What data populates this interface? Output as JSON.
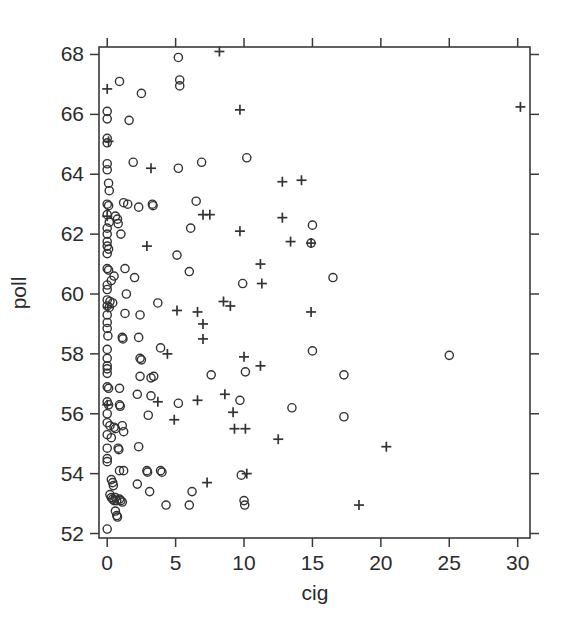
{
  "chart_data": {
    "type": "scatter",
    "title": "",
    "xlabel": "cig",
    "ylabel": "poll",
    "xlim": [
      -0.6,
      30.9
    ],
    "ylim": [
      51.85,
      68.25
    ],
    "xticks": [
      0,
      5,
      10,
      15,
      20,
      25,
      30
    ],
    "xtick_labels": [
      "0",
      "5",
      "10",
      "15",
      "20",
      "25",
      "30"
    ],
    "yticks": [
      52,
      54,
      56,
      58,
      60,
      62,
      64,
      66,
      68
    ],
    "ytick_labels": [
      "52",
      "54",
      "56",
      "58",
      "60",
      "62",
      "64",
      "66",
      "68"
    ],
    "grid": false,
    "legend": null,
    "legend_position": "none",
    "box_frame": true,
    "tick_direction": "outward",
    "ticks_on_all_sides": true,
    "marker_color": "#333333",
    "axis_color": "#3a3a3a",
    "background_color": "#ffffff",
    "series": [
      {
        "name": "open-circle",
        "marker": "circle",
        "points": [
          [
            5.2,
            67.9
          ],
          [
            0.9,
            67.1
          ],
          [
            5.3,
            67.15
          ],
          [
            5.3,
            66.95
          ],
          [
            2.5,
            66.7
          ],
          [
            0.0,
            66.1
          ],
          [
            0.0,
            65.85
          ],
          [
            1.6,
            65.8
          ],
          [
            0.0,
            65.2
          ],
          [
            0.0,
            65.05
          ],
          [
            0.0,
            64.35
          ],
          [
            0.0,
            64.15
          ],
          [
            1.9,
            64.4
          ],
          [
            5.2,
            64.2
          ],
          [
            6.9,
            64.4
          ],
          [
            10.2,
            64.55
          ],
          [
            0.1,
            63.7
          ],
          [
            0.15,
            63.45
          ],
          [
            0.0,
            63.0
          ],
          [
            0.1,
            62.95
          ],
          [
            1.2,
            63.05
          ],
          [
            1.5,
            63.0
          ],
          [
            2.3,
            62.9
          ],
          [
            3.3,
            63.0
          ],
          [
            3.35,
            62.95
          ],
          [
            6.5,
            63.1
          ],
          [
            0.0,
            62.65
          ],
          [
            0.6,
            62.6
          ],
          [
            0.75,
            62.5
          ],
          [
            0.15,
            62.4
          ],
          [
            0.0,
            62.2
          ],
          [
            0.0,
            62.0
          ],
          [
            1.0,
            62.0
          ],
          [
            0.8,
            62.35
          ],
          [
            6.1,
            62.2
          ],
          [
            15.0,
            62.3
          ],
          [
            0.0,
            61.75
          ],
          [
            0.0,
            61.6
          ],
          [
            0.1,
            61.5
          ],
          [
            0.0,
            61.35
          ],
          [
            5.1,
            61.3
          ],
          [
            14.9,
            61.7
          ],
          [
            0.0,
            60.85
          ],
          [
            0.1,
            60.8
          ],
          [
            1.3,
            60.85
          ],
          [
            0.5,
            60.6
          ],
          [
            2.0,
            60.55
          ],
          [
            6.0,
            60.75
          ],
          [
            0.3,
            60.45
          ],
          [
            0.0,
            60.3
          ],
          [
            0.0,
            60.15
          ],
          [
            9.9,
            60.35
          ],
          [
            16.5,
            60.55
          ],
          [
            1.4,
            60.0
          ],
          [
            0.0,
            59.8
          ],
          [
            0.2,
            59.75
          ],
          [
            0.4,
            59.7
          ],
          [
            0.0,
            59.6
          ],
          [
            0.15,
            59.55
          ],
          [
            3.7,
            59.7
          ],
          [
            0.0,
            59.3
          ],
          [
            1.3,
            59.35
          ],
          [
            2.4,
            59.3
          ],
          [
            0.0,
            59.05
          ],
          [
            0.0,
            58.85
          ],
          [
            0.05,
            58.6
          ],
          [
            1.1,
            58.55
          ],
          [
            1.15,
            58.5
          ],
          [
            2.3,
            58.55
          ],
          [
            3.9,
            58.2
          ],
          [
            0.0,
            58.15
          ],
          [
            0.0,
            57.85
          ],
          [
            2.4,
            57.85
          ],
          [
            2.5,
            57.8
          ],
          [
            15.0,
            58.1
          ],
          [
            25.0,
            57.95
          ],
          [
            0.0,
            57.6
          ],
          [
            0.0,
            57.5
          ],
          [
            0.0,
            57.35
          ],
          [
            2.4,
            57.25
          ],
          [
            3.2,
            57.2
          ],
          [
            3.4,
            57.25
          ],
          [
            7.6,
            57.3
          ],
          [
            10.1,
            57.4
          ],
          [
            17.3,
            57.3
          ],
          [
            0.0,
            56.9
          ],
          [
            0.1,
            56.85
          ],
          [
            0.9,
            56.85
          ],
          [
            2.2,
            56.65
          ],
          [
            3.2,
            56.6
          ],
          [
            0.0,
            56.4
          ],
          [
            0.1,
            56.3
          ],
          [
            0.9,
            56.3
          ],
          [
            0.95,
            56.25
          ],
          [
            5.2,
            56.35
          ],
          [
            9.7,
            56.45
          ],
          [
            13.5,
            56.2
          ],
          [
            0.0,
            56.0
          ],
          [
            3.0,
            55.95
          ],
          [
            17.3,
            55.9
          ],
          [
            0.0,
            55.7
          ],
          [
            0.2,
            55.6
          ],
          [
            0.5,
            55.55
          ],
          [
            0.6,
            55.5
          ],
          [
            1.1,
            55.6
          ],
          [
            0.0,
            55.3
          ],
          [
            0.3,
            55.2
          ],
          [
            1.2,
            55.4
          ],
          [
            0.0,
            54.85
          ],
          [
            0.8,
            54.85
          ],
          [
            0.85,
            54.8
          ],
          [
            2.3,
            54.9
          ],
          [
            0.0,
            54.5
          ],
          [
            0.0,
            54.4
          ],
          [
            0.9,
            54.1
          ],
          [
            1.2,
            54.1
          ],
          [
            2.9,
            54.1
          ],
          [
            2.95,
            54.05
          ],
          [
            3.9,
            54.1
          ],
          [
            4.0,
            54.05
          ],
          [
            9.8,
            53.95
          ],
          [
            0.3,
            53.8
          ],
          [
            0.4,
            53.7
          ],
          [
            0.45,
            53.6
          ],
          [
            2.2,
            53.65
          ],
          [
            0.2,
            53.3
          ],
          [
            0.3,
            53.2
          ],
          [
            0.4,
            53.15
          ],
          [
            0.5,
            53.1
          ],
          [
            0.6,
            53.2
          ],
          [
            0.7,
            53.1
          ],
          [
            0.9,
            53.15
          ],
          [
            1.0,
            53.1
          ],
          [
            1.1,
            53.05
          ],
          [
            3.1,
            53.4
          ],
          [
            6.2,
            53.4
          ],
          [
            0.6,
            52.75
          ],
          [
            0.7,
            52.6
          ],
          [
            0.75,
            52.55
          ],
          [
            4.3,
            52.95
          ],
          [
            6.0,
            52.95
          ],
          [
            10.0,
            53.1
          ],
          [
            10.05,
            52.95
          ],
          [
            0.0,
            52.15
          ]
        ]
      },
      {
        "name": "plus",
        "marker": "plus",
        "points": [
          [
            8.2,
            68.1
          ],
          [
            0.0,
            66.85
          ],
          [
            30.2,
            66.25
          ],
          [
            9.7,
            66.15
          ],
          [
            3.2,
            64.2
          ],
          [
            12.8,
            63.75
          ],
          [
            14.2,
            63.8
          ],
          [
            0.1,
            65.1
          ],
          [
            7.0,
            62.65
          ],
          [
            7.5,
            62.65
          ],
          [
            12.8,
            62.55
          ],
          [
            9.7,
            62.1
          ],
          [
            13.4,
            61.75
          ],
          [
            14.9,
            61.7
          ],
          [
            2.9,
            61.6
          ],
          [
            11.2,
            61.0
          ],
          [
            11.3,
            60.35
          ],
          [
            8.5,
            59.75
          ],
          [
            9.0,
            59.6
          ],
          [
            5.1,
            59.45
          ],
          [
            6.6,
            59.4
          ],
          [
            14.9,
            59.4
          ],
          [
            7.0,
            59.0
          ],
          [
            7.0,
            58.5
          ],
          [
            4.4,
            58.0
          ],
          [
            10.0,
            57.9
          ],
          [
            11.2,
            57.6
          ],
          [
            6.6,
            56.45
          ],
          [
            3.7,
            56.4
          ],
          [
            8.6,
            56.65
          ],
          [
            9.2,
            56.05
          ],
          [
            4.9,
            55.8
          ],
          [
            9.3,
            55.5
          ],
          [
            10.1,
            55.5
          ],
          [
            12.5,
            55.15
          ],
          [
            20.4,
            54.9
          ],
          [
            10.2,
            54.0
          ],
          [
            7.3,
            53.7
          ],
          [
            18.4,
            52.95
          ],
          [
            0.0,
            62.6
          ],
          [
            0.05,
            59.55
          ],
          [
            0.0,
            56.3
          ]
        ]
      }
    ]
  },
  "axes": {
    "x_title": "cig",
    "y_title": "poll"
  }
}
